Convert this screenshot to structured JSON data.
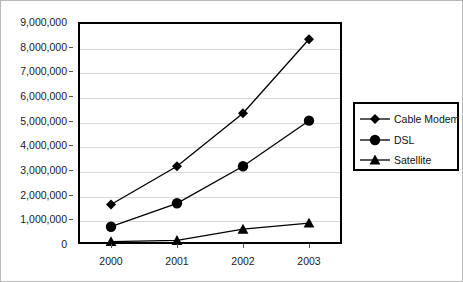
{
  "chart_data": {
    "type": "line",
    "title": "",
    "subtitle": "",
    "xlabel": "",
    "ylabel": "",
    "categories": [
      "2000",
      "2001",
      "2002",
      "2003"
    ],
    "x": [
      2000,
      2001,
      2002,
      2003
    ],
    "ylim": [
      0,
      9000000
    ],
    "y_ticks": [
      0,
      1000000,
      2000000,
      3000000,
      4000000,
      5000000,
      6000000,
      7000000,
      8000000,
      9000000
    ],
    "y_tick_labels": [
      "0",
      "1,000,000",
      "2,000,000",
      "3,000,000",
      "4,000,000",
      "5,000,000",
      "6,000,000",
      "7,000,000",
      "8,000,000",
      "9,000,000"
    ],
    "grid": true,
    "grid_axis": "y",
    "legend_position": "right",
    "series": [
      {
        "name": "Cable Modem",
        "marker": "diamond",
        "color": "#000000",
        "values": [
          1600000,
          3150000,
          5300000,
          8300000
        ]
      },
      {
        "name": "DSL",
        "marker": "circle",
        "color": "#000000",
        "values": [
          700000,
          1650000,
          3150000,
          5000000
        ]
      },
      {
        "name": "Satellite",
        "marker": "triangle",
        "color": "#000000",
        "values": [
          100000,
          150000,
          600000,
          850000
        ]
      }
    ]
  },
  "legend": {
    "items": [
      {
        "label": "Cable Modem",
        "marker": "diamond-marker-icon"
      },
      {
        "label": "DSL",
        "marker": "circle-marker-icon"
      },
      {
        "label": "Satellite",
        "marker": "triangle-marker-icon"
      }
    ]
  },
  "axes": {
    "y_labels": [
      "9,000,000",
      "8,000,000",
      "7,000,000",
      "6,000,000",
      "5,000,000",
      "4,000,000",
      "3,000,000",
      "2,000,000",
      "1,000,000",
      "0"
    ],
    "x_labels": [
      "2000",
      "2001",
      "2002",
      "2003"
    ]
  },
  "colors": {
    "series": "#000000",
    "grid": "#d9d9d9",
    "frame": "#000000",
    "background": "#ffffff",
    "text": "#1a1a1a"
  }
}
